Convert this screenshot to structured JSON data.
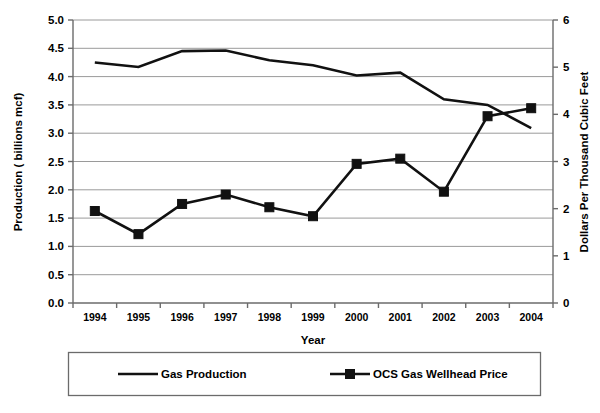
{
  "chart_data": {
    "type": "line",
    "title": "",
    "xlabel": "Year",
    "ylabel": "Production ( billions mcf)",
    "y2label": "Dollars Per Thousand Cubic Feet",
    "categories": [
      "1994",
      "1995",
      "1996",
      "1997",
      "1998",
      "1999",
      "2000",
      "2001",
      "2002",
      "2003",
      "2004"
    ],
    "ylim": [
      0.0,
      5.0
    ],
    "y2lim": [
      0,
      6
    ],
    "yticks": [
      "0.0",
      "0.5",
      "1.0",
      "1.5",
      "2.0",
      "2.5",
      "3.0",
      "3.5",
      "4.0",
      "4.5",
      "5.0"
    ],
    "y2ticks": [
      "0",
      "1",
      "2",
      "3",
      "4",
      "5",
      "6"
    ],
    "grid": true,
    "legend_position": "bottom",
    "series": [
      {
        "name": "Gas Production",
        "axis": "left",
        "marker": "none",
        "color": "#111111",
        "values": [
          4.25,
          4.17,
          4.45,
          4.46,
          4.29,
          4.2,
          4.02,
          4.07,
          3.6,
          3.5,
          3.09
        ]
      },
      {
        "name": "OCS Gas Wellhead Price",
        "axis": "right",
        "marker": "square",
        "color": "#111111",
        "values": [
          1.95,
          1.46,
          2.1,
          2.3,
          2.03,
          1.84,
          2.95,
          3.06,
          2.36,
          3.96,
          4.13
        ]
      }
    ]
  },
  "legend": {
    "items": [
      {
        "label": "Gas Production",
        "marker": "none"
      },
      {
        "label": "OCS Gas Wellhead Price",
        "marker": "square"
      }
    ]
  }
}
